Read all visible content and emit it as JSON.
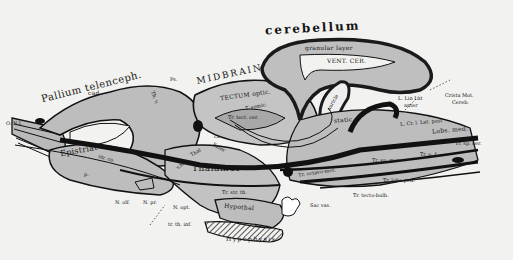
{
  "figure": {
    "type": "anatomical sagittal brain diagram",
    "background": "#f2f2f0",
    "tissue_fill": "#bdbdbd",
    "ink": "#111111"
  },
  "labels": {
    "cerebellum": "cerebellum",
    "granular_layer": "granular layer",
    "vent_cer": "VENT. CER.",
    "auricle": "auricle",
    "midbrain": "MIDBRAIN",
    "tectum_optic": "TECTUM optic.",
    "t_semic": "T. semic.",
    "tr_tect_cer": "Tr. tect. cer.",
    "cx": "cx",
    "pallium": "Pallium telenceph.",
    "pallium_ps": "Ps.",
    "cad": "cad",
    "thalamus_sup": "Th. v.",
    "n_i": "O. N.I.",
    "epistriat": "Epistriat",
    "str": "str. co.",
    "p": "p.",
    "thal": "Thal",
    "exter": "Exter",
    "thalamus": "Thalamus",
    "v_h": "v.h.",
    "static": "static",
    "lin_lat": "L. Lin Lat",
    "lin_lat_sub": "anter",
    "crista": "Crista Mot.",
    "crista_sub": "Cereb.",
    "cr_lat_post": "L. Cr. l. Lat. post",
    "lobus_med": "Lobs. med.",
    "tr_sp_cer": "Tr. sp. cer.",
    "tr_olf": "Tr. o. f.",
    "tr_sp_mes": "Tr. sp. mes.",
    "tr_octavo": "Tr. octavo-mot.",
    "tr_lobo_ped": "Tr. lobo-ped.",
    "tr_tecto_bulb": "Tr. tecto-bulb.",
    "hypoth": "Hypothal",
    "tr_st_h": "Tr. str. th.",
    "sac_vas": "Sac vas.",
    "hypophysis": "Hypophysis",
    "n_olf": "N. olf.",
    "n_pr": "N. pr.",
    "n_opt": "N. opt.",
    "tr_th_inf": "tr. th. inf."
  }
}
